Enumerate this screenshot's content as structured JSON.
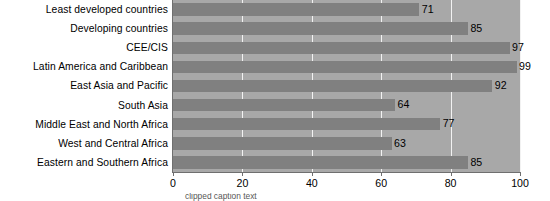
{
  "chart_data": {
    "type": "bar",
    "orientation": "horizontal",
    "title": "",
    "xlabel": "",
    "ylabel": "",
    "xlim": [
      0,
      100
    ],
    "xticks": [
      0,
      20,
      40,
      60,
      80,
      100
    ],
    "grid": true,
    "legend": null,
    "bar_color": "#808080",
    "plot_background": "#a8a8a8",
    "gridline_color": "#f2f2f2",
    "categories": [
      "Least developed countries",
      "Developing countries",
      "CEE/CIS",
      "Latin America and Caribbean",
      "East Asia and Pacific",
      "South Asia",
      "Middle East and North Africa",
      "West and Central Africa",
      "Eastern and Southern Africa"
    ],
    "values": [
      71,
      85,
      97,
      99,
      92,
      64,
      77,
      63,
      85
    ],
    "value_labels": [
      "71",
      "85",
      "97",
      "99",
      "92",
      "64",
      "77",
      "63",
      "85"
    ],
    "xtick_labels": [
      "0",
      "20",
      "40",
      "60",
      "80",
      "100"
    ]
  },
  "caption": {
    "partial_text": "clipped caption text"
  }
}
